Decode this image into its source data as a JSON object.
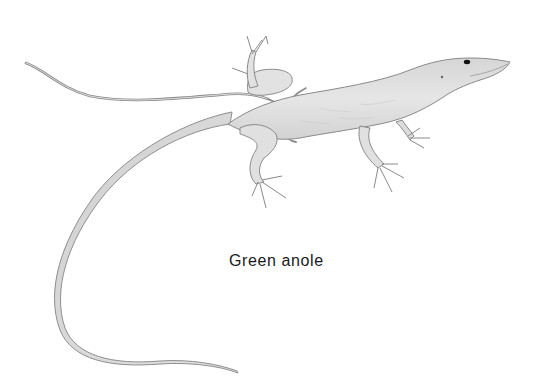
{
  "figure": {
    "caption": "Green anole",
    "style": "grayscale pencil drawing",
    "colors": {
      "background": "#ffffff",
      "body_fill": "#e4e4e4",
      "shading": "#cfcfcf",
      "outline": "#8a8a8a",
      "thread": "#7a7a7a",
      "eye": "#111111",
      "caption_text": "#1a1a1a"
    }
  }
}
